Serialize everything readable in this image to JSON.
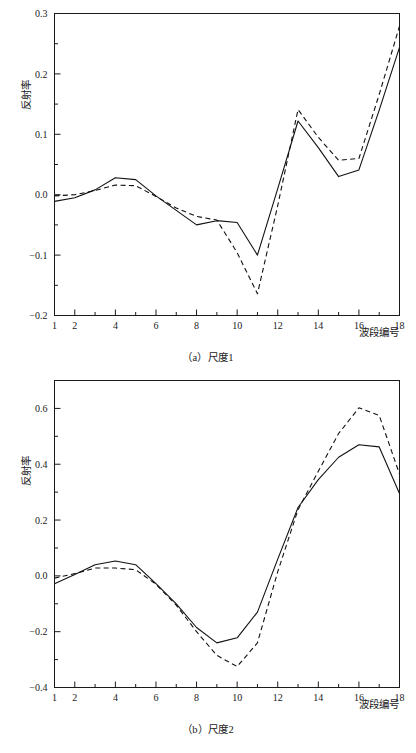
{
  "figures": [
    {
      "id": "a",
      "caption": "（a）尺度1",
      "xlabel": "波段编号",
      "ylabel": "反射率"
    },
    {
      "id": "b",
      "caption": "（b）尺度2",
      "xlabel": "波段编号",
      "ylabel": "反射率"
    }
  ],
  "chart_data": [
    {
      "type": "line",
      "title": "（a）尺度1",
      "xlabel": "波段编号",
      "ylabel": "反射率",
      "xlim": [
        1,
        18
      ],
      "ylim": [
        -0.2,
        0.3
      ],
      "xticks": [
        1,
        2,
        4,
        6,
        8,
        10,
        12,
        14,
        16,
        18
      ],
      "xtick_labels": [
        "1",
        "2",
        "4",
        "6",
        "8",
        "10",
        "12",
        "14",
        "16",
        "18"
      ],
      "xminor_ticks": [
        3,
        5,
        7,
        9,
        11,
        13,
        15,
        17
      ],
      "yticks": [
        -0.2,
        -0.1,
        0.0,
        0.1,
        0.2,
        0.3
      ],
      "ytick_labels": [
        "−0.2",
        "−0.1",
        "0.0",
        "0.1",
        "0.2",
        "0.3"
      ],
      "yminor_ticks": [
        -0.15,
        -0.05,
        0.05,
        0.15,
        0.25
      ],
      "grid": false,
      "legend": "none",
      "x": [
        1,
        2,
        3,
        4,
        5,
        6,
        7,
        8,
        9,
        10,
        11,
        12,
        13,
        14,
        15,
        16,
        17,
        18
      ],
      "series": [
        {
          "name": "solid",
          "style": "solid",
          "values": [
            -0.011,
            -0.005,
            0.008,
            0.028,
            0.025,
            -0.002,
            -0.026,
            -0.05,
            -0.043,
            -0.046,
            -0.1,
            0.01,
            0.122,
            0.078,
            0.03,
            0.041,
            0.14,
            0.244
          ]
        },
        {
          "name": "dashed",
          "style": "dashed",
          "values": [
            -0.002,
            0.0,
            0.007,
            0.016,
            0.015,
            -0.003,
            -0.022,
            -0.036,
            -0.042,
            -0.096,
            -0.164,
            -0.018,
            0.141,
            0.095,
            0.057,
            0.06,
            0.166,
            0.279
          ]
        }
      ]
    },
    {
      "type": "line",
      "title": "（b）尺度2",
      "xlabel": "波段编号",
      "ylabel": "反射率",
      "xlim": [
        1,
        18
      ],
      "ylim": [
        -0.4,
        0.7
      ],
      "xticks": [
        1,
        2,
        4,
        6,
        8,
        10,
        12,
        14,
        16,
        18
      ],
      "xtick_labels": [
        "1",
        "2",
        "4",
        "6",
        "8",
        "10",
        "12",
        "14",
        "16",
        "18"
      ],
      "xminor_ticks": [
        3,
        5,
        7,
        9,
        11,
        13,
        15,
        17
      ],
      "yticks": [
        -0.4,
        -0.2,
        0.0,
        0.2,
        0.4,
        0.6
      ],
      "ytick_labels": [
        "−0.4",
        "−0.2",
        "0.0",
        "0.2",
        "0.4",
        "0.6"
      ],
      "yminor_ticks": [
        -0.3,
        -0.1,
        0.1,
        0.3,
        0.5,
        0.7
      ],
      "grid": false,
      "legend": "none",
      "x": [
        1,
        2,
        3,
        4,
        5,
        6,
        7,
        8,
        9,
        10,
        11,
        12,
        13,
        14,
        15,
        16,
        17,
        18
      ],
      "series": [
        {
          "name": "solid",
          "style": "solid",
          "values": [
            -0.028,
            0.005,
            0.04,
            0.053,
            0.04,
            -0.028,
            -0.1,
            -0.185,
            -0.24,
            -0.222,
            -0.13,
            0.06,
            0.245,
            0.345,
            0.425,
            0.47,
            0.462,
            0.295
          ]
        },
        {
          "name": "dashed",
          "style": "dashed",
          "values": [
            -0.008,
            0.008,
            0.028,
            0.028,
            0.022,
            -0.03,
            -0.105,
            -0.2,
            -0.285,
            -0.325,
            -0.24,
            0.015,
            0.237,
            0.375,
            0.51,
            0.602,
            0.575,
            0.365
          ]
        }
      ]
    }
  ]
}
